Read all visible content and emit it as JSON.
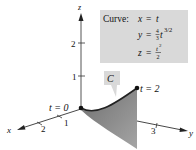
{
  "figure": {
    "axes": {
      "x_label": "x",
      "y_label": "y",
      "z_label": "z",
      "x_ticks": [
        "1",
        "2"
      ],
      "y_ticks": [
        "3"
      ],
      "z_ticks": [
        "1",
        "2"
      ]
    },
    "curve_name": "C",
    "start_label": "t = 0",
    "end_label": "t = 2",
    "equations_box": {
      "title": "Curve:",
      "eq_x_lhs": "x",
      "eq_x_rhs": "t",
      "eq_y_lhs": "y",
      "eq_y_coef_num": "4",
      "eq_y_coef_den": "3",
      "eq_y_var": "t",
      "eq_y_exp": "3/2",
      "eq_z_lhs": "z",
      "eq_z_num": "t",
      "eq_z_num_exp": "2",
      "eq_z_den": "2",
      "equals": "="
    },
    "colors": {
      "box_fill": "#d9d9d9",
      "surface_fill": "#8a8a8a",
      "curve": "#222222",
      "axis": "#333333"
    }
  }
}
